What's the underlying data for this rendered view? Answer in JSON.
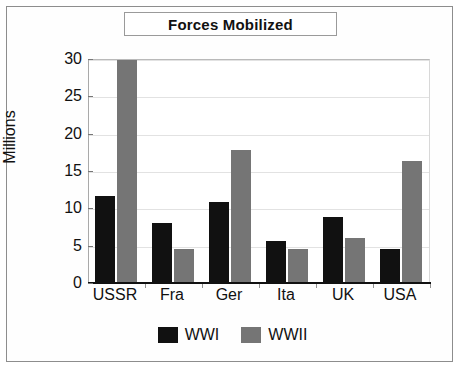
{
  "frame": {
    "name": "scanned-page-border"
  },
  "chart_data": {
    "type": "bar",
    "title": "Forces Mobilized",
    "xlabel": "",
    "ylabel": "Millions",
    "categories": [
      "USSR",
      "Fra",
      "Ger",
      "Ita",
      "UK",
      "USA"
    ],
    "series": [
      {
        "name": "WWI",
        "color": "#111111",
        "values": [
          11.8,
          8.2,
          11.0,
          5.7,
          9.0,
          4.7
        ]
      },
      {
        "name": "WWII",
        "color": "#757575",
        "values": [
          30.0,
          4.7,
          18.0,
          4.7,
          6.1,
          16.5
        ]
      }
    ],
    "ylim": [
      0,
      30
    ],
    "yticks": [
      0,
      5,
      10,
      15,
      20,
      25,
      30
    ],
    "ytick_labels": [
      "0",
      "5",
      "10",
      "15",
      "20",
      "25",
      "30"
    ],
    "grid": true,
    "legend_position": "bottom"
  }
}
